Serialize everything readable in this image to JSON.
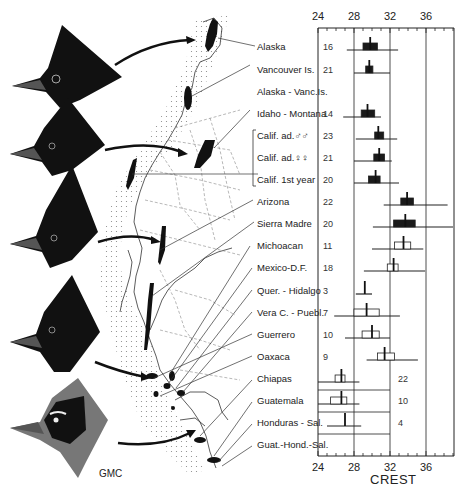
{
  "figure": {
    "signature": "GMC",
    "axis_title": "CREST",
    "axis_ticks": [
      "24",
      "28",
      "32",
      "36"
    ]
  },
  "bird_heads": [
    {
      "name": "northern-dark-crested-head",
      "maps_to": "Alaska"
    },
    {
      "name": "interior-dark-crested-head",
      "maps_to": "Calif."
    },
    {
      "name": "long-crested-head",
      "maps_to": "Sierra Madre"
    },
    {
      "name": "mexican-crested-head",
      "maps_to": "Guerrero"
    },
    {
      "name": "pale-bordered-head",
      "maps_to": "Guatemala"
    }
  ],
  "chart_data": {
    "type": "range-bar",
    "title": "",
    "xlabel": "CREST",
    "ylabel": "",
    "xlim": [
      24,
      39
    ],
    "xticks": [
      24,
      28,
      32,
      36
    ],
    "grid": "vertical at 28, 32, 36",
    "legend": "filled box = dark-crested populations; open box = Mexican/Central American populations",
    "categories": [
      "Alaska",
      "Vancouver Is.",
      "Alaska - Vanc.Is.",
      "Idaho - Montana",
      "Calif. ad.♂♂",
      "Calif. ad.♀♀",
      "Calif. 1st year",
      "Arizona",
      "Sierra Madre",
      "Michoacan",
      "Mexico-D.F.",
      "Quer. - Hidalgo",
      "Vera C. - Puebl.",
      "Guerrero",
      "Oaxaca",
      "Chiapas",
      "Guatemala",
      "Honduras - Sal.",
      "Guat.-Hond.-Sal."
    ],
    "series": [
      {
        "name": "n",
        "values": [
          16,
          21,
          null,
          14,
          23,
          21,
          20,
          22,
          20,
          11,
          18,
          3,
          7,
          10,
          9,
          22,
          10,
          4,
          null
        ]
      },
      {
        "name": "min",
        "values": [
          27.2,
          28.0,
          null,
          26.8,
          28.2,
          28.0,
          28.0,
          31.3,
          30.1,
          30.0,
          29.1,
          28.2,
          25.8,
          27.0,
          29.4,
          24.0,
          24.0,
          25.0,
          null
        ]
      },
      {
        "name": "max",
        "values": [
          32.9,
          32.0,
          null,
          31.0,
          32.8,
          32.2,
          33.0,
          38.4,
          39.0,
          35.7,
          35.9,
          30.0,
          33.1,
          32.0,
          35.1,
          28.6,
          28.6,
          28.8,
          null
        ]
      },
      {
        "name": "box_low",
        "values": [
          29.0,
          29.3,
          null,
          28.8,
          30.3,
          30.2,
          29.6,
          33.2,
          32.4,
          32.5,
          31.7,
          null,
          28.0,
          28.9,
          30.6,
          25.9,
          25.4,
          null,
          null
        ]
      },
      {
        "name": "box_high",
        "values": [
          30.6,
          30.1,
          null,
          30.3,
          31.3,
          31.4,
          30.9,
          34.6,
          34.8,
          34.3,
          32.9,
          null,
          30.8,
          30.8,
          32.5,
          27.0,
          27.2,
          null,
          null
        ]
      },
      {
        "name": "mean",
        "values": [
          29.8,
          29.7,
          null,
          29.5,
          30.7,
          30.8,
          30.4,
          33.9,
          33.7,
          33.5,
          32.4,
          29.2,
          29.4,
          30.0,
          31.4,
          26.6,
          26.6,
          27.0,
          null
        ]
      },
      {
        "name": "filled",
        "values": [
          true,
          true,
          null,
          true,
          true,
          true,
          true,
          true,
          true,
          false,
          false,
          null,
          false,
          false,
          false,
          false,
          false,
          null,
          null
        ]
      }
    ]
  },
  "rows": [
    {
      "label": "Alaska",
      "n": "16",
      "y": 47
    },
    {
      "label": "Vancouver Is.",
      "n": "21",
      "y": 70
    },
    {
      "label": "Alaska - Vanc.Is.",
      "n": "",
      "y": 92
    },
    {
      "label": "Idaho - Montana",
      "n": "14",
      "y": 114
    },
    {
      "label": "Calif.  ad.♂♂",
      "n": "23",
      "y": 136
    },
    {
      "label": "Calif.  ad.♀♀",
      "n": "21",
      "y": 158
    },
    {
      "label": "Calif.  1st year",
      "n": "20",
      "y": 180
    },
    {
      "label": "Arizona",
      "n": "22",
      "y": 202
    },
    {
      "label": "Sierra Madre",
      "n": "20",
      "y": 224
    },
    {
      "label": "Michoacan",
      "n": "11",
      "y": 246
    },
    {
      "label": "Mexico-D.F.",
      "n": "18",
      "y": 268
    },
    {
      "label": "Quer. - Hidalgo",
      "n": "3",
      "y": 291
    },
    {
      "label": "Vera C. - Puebl.",
      "n": "7",
      "y": 313
    },
    {
      "label": "Guerrero",
      "n": "10",
      "y": 335
    },
    {
      "label": "Oaxaca",
      "n": "9",
      "y": 357
    },
    {
      "label": "Chiapas",
      "n": "22",
      "y": 379
    },
    {
      "label": "Guatemala",
      "n": "10",
      "y": 401
    },
    {
      "label": "Honduras - Sal.",
      "n": "4",
      "y": 423
    },
    {
      "label": "Guat.-Hond.-Sal.",
      "n": "",
      "y": 445
    }
  ]
}
